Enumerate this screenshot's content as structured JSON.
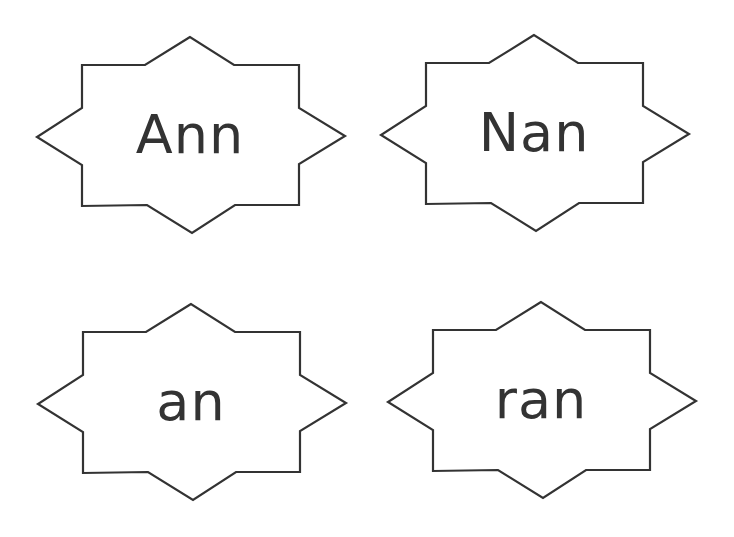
{
  "page": {
    "background": "#ffffff",
    "stroke_color": "#333333",
    "text_color": "#333333"
  },
  "cards": [
    {
      "word": "Ann",
      "position": "top-left"
    },
    {
      "word": "Nan",
      "position": "top-right"
    },
    {
      "word": "an",
      "position": "bottom-left"
    },
    {
      "word": "ran",
      "position": "bottom-right"
    }
  ]
}
